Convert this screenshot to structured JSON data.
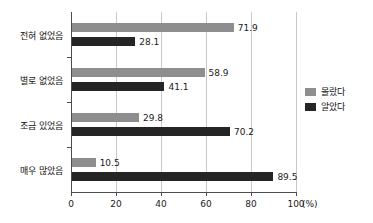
{
  "chart_data": {
    "type": "bar",
    "orientation": "horizontal",
    "title": "",
    "subtitle": "",
    "xlabel": "(%)",
    "ylabel": "",
    "xlim": [
      0,
      100
    ],
    "xticks": [
      0,
      20,
      40,
      60,
      80,
      100
    ],
    "xtick_labels": [
      "0",
      "20",
      "40",
      "60",
      "80",
      "100"
    ],
    "x_unit_label": "(%)",
    "grid": "vertical",
    "legend_position": "right",
    "categories": [
      "전혀 없었음",
      "별로 없었음",
      "조금 있었음",
      "매우 많았음"
    ],
    "series": [
      {
        "name": "몰랐다",
        "color": "#8e8e8e",
        "values": [
          71.9,
          58.9,
          29.8,
          10.5
        ],
        "value_labels": [
          "71.9",
          "58.9",
          "29.8",
          "10.5"
        ]
      },
      {
        "name": "알았다",
        "color": "#252525",
        "values": [
          28.1,
          41.1,
          70.2,
          89.5
        ],
        "value_labels": [
          "28.1",
          "41.1",
          "70.2",
          "89.5"
        ]
      }
    ]
  },
  "colors": {
    "series_0": "#8e8e8e",
    "series_1": "#252525",
    "axis": "#4d4d4d",
    "grid": "#c8c8c8",
    "text": "#111111",
    "background": "#ffffff"
  }
}
